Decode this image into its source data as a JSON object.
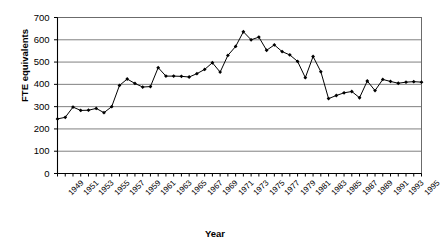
{
  "chart_data": {
    "type": "line",
    "title": "",
    "xlabel": "Year",
    "ylabel": "FTE equivalents",
    "ylim": [
      0,
      700
    ],
    "ytick_values": [
      0,
      100,
      200,
      300,
      400,
      500,
      600,
      700
    ],
    "ytick_labels": [
      "0",
      "100",
      "200",
      "300",
      "400",
      "500",
      "600",
      "700"
    ],
    "xlim": [
      1949,
      1996
    ],
    "xtick_labels": [
      "1949",
      "1951",
      "1953",
      "1955",
      "1957",
      "1959",
      "1961",
      "1963",
      "1965",
      "1967",
      "1969",
      "1971",
      "1973",
      "1975",
      "1977",
      "1979",
      "1981",
      "1983",
      "1985",
      "1987",
      "1989",
      "1991",
      "1993",
      "1995"
    ],
    "grid": true,
    "legend": null,
    "marker": "filled-diamond",
    "line_color": "#000000",
    "grid_color": "#808080",
    "x": [
      1949,
      1950,
      1951,
      1952,
      1953,
      1954,
      1955,
      1956,
      1957,
      1958,
      1959,
      1960,
      1961,
      1962,
      1963,
      1964,
      1965,
      1966,
      1967,
      1968,
      1969,
      1970,
      1971,
      1972,
      1973,
      1974,
      1975,
      1976,
      1977,
      1978,
      1979,
      1980,
      1981,
      1982,
      1983,
      1984,
      1985,
      1986,
      1987,
      1988,
      1989,
      1990,
      1991,
      1992,
      1993,
      1994,
      1995,
      1996
    ],
    "values": [
      245,
      252,
      298,
      283,
      284,
      292,
      273,
      300,
      395,
      424,
      404,
      388,
      390,
      475,
      437,
      437,
      436,
      433,
      448,
      467,
      497,
      455,
      530,
      570,
      636,
      600,
      612,
      553,
      577,
      547,
      532,
      503,
      430,
      525,
      457,
      336,
      350,
      362,
      368,
      340,
      415,
      372,
      422,
      413,
      405,
      410,
      412,
      410
    ]
  }
}
